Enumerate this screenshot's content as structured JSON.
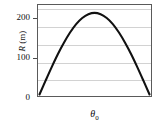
{
  "chart_data": {
    "type": "line",
    "title": "",
    "xlabel": "θ₀",
    "xlabel_symbol": "θ",
    "xlabel_subscript": "0",
    "ylabel": "R (m)",
    "ylabel_symbol": "R",
    "ylabel_unit": "(m)",
    "xlim": [
      0,
      90
    ],
    "ylim": [
      0,
      260
    ],
    "grid": true,
    "grid_axis": "y",
    "grid_values": [
      50,
      100,
      150,
      200,
      250
    ],
    "legend": null,
    "y_ticks": [
      {
        "value": 0,
        "label": "0"
      },
      {
        "value": 100,
        "label": "100"
      },
      {
        "value": 200,
        "label": "200"
      }
    ],
    "x_ticks": [],
    "series": [
      {
        "name": "Range vs launch angle",
        "x": [
          0,
          5,
          10,
          15,
          20,
          25,
          30,
          35,
          40,
          45,
          50,
          55,
          60,
          65,
          70,
          75,
          80,
          85,
          90
        ],
        "y": [
          0,
          41,
          81,
          119,
          153,
          183,
          208,
          226,
          237,
          241,
          237,
          226,
          208,
          183,
          153,
          119,
          81,
          41,
          0
        ],
        "peak_x": 45,
        "peak_y": 241,
        "color": "#111111",
        "linewidth": 2
      }
    ]
  },
  "figure": {
    "background": "#ffffff",
    "frame_color": "#5a5a5a",
    "gridline_color": "#d2d2d2",
    "text_color": "#111111"
  }
}
